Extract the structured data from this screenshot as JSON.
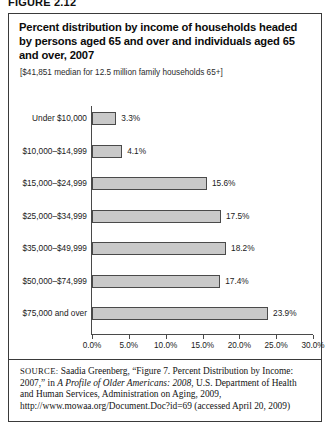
{
  "figure": {
    "number_label": "FIGURE 2.12"
  },
  "title": "Percent distribution by income of households headed by persons aged 65 and over and individuals aged 65 and over, 2007",
  "subtitle": "[$41,851 median for 12.5 million family households 65+]",
  "source": {
    "prefix": "SOURCE:",
    "text_before_italic": " Saadia Greenberg, “Figure 7. Percent Distribution by Income: 2007,” in ",
    "italic_title": "A Profile of Older Americans: 2008",
    "text_after_italic": ", U.S. Department of Health and Human Services, Administration on Aging, 2009, http://www.mowaa.org/Document.Doc?id=69 (accessed April 20, 2009)"
  },
  "chart_data": {
    "type": "bar",
    "orientation": "horizontal",
    "title": "Percent distribution by income of households headed by persons aged 65 and over and individuals aged 65 and over, 2007",
    "subtitle": "[$41,851 median for 12.5 million family households 65+]",
    "xlabel": "",
    "ylabel": "",
    "xlim": [
      0,
      30
    ],
    "grid": false,
    "legend": false,
    "bar_color": "#c9c9c9",
    "bar_border_color": "#4a4a4a",
    "categories": [
      "Under $10,000",
      "$10,000–$14,999",
      "$15,000–$24,999",
      "$25,000–$34,999",
      "$35,000–$49,999",
      "$50,000–$74,999",
      "$75,000 and over"
    ],
    "values": [
      3.3,
      4.1,
      15.6,
      17.5,
      18.2,
      17.4,
      23.9
    ],
    "value_labels": [
      "3.3%",
      "4.1%",
      "15.6%",
      "17.5%",
      "18.2%",
      "17.4%",
      "23.9%"
    ],
    "xticks": [
      0,
      5,
      10,
      15,
      20,
      25,
      30
    ],
    "xtick_labels": [
      "0.0%",
      "5.0%",
      "10.0%",
      "15.0%",
      "20.0%",
      "25.0%",
      "30.0%"
    ]
  }
}
